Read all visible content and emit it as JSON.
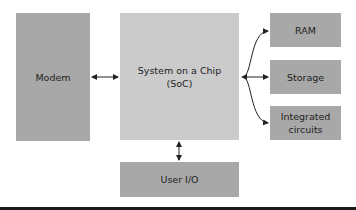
{
  "diagram": {
    "nodes": {
      "modem": {
        "label": "Modem"
      },
      "soc": {
        "label_line1": "System on a Chip",
        "label_line2": "(SoC)"
      },
      "ram": {
        "label": "RAM"
      },
      "storage": {
        "label": "Storage"
      },
      "ic": {
        "label_line1": "Integrated",
        "label_line2": "circuits"
      },
      "userio": {
        "label": "User I/O"
      }
    },
    "edges": [
      {
        "from": "modem",
        "to": "soc",
        "type": "bidirectional"
      },
      {
        "from": "soc",
        "to": "ram",
        "type": "directed"
      },
      {
        "from": "soc",
        "to": "storage",
        "type": "directed"
      },
      {
        "from": "soc",
        "to": "ic",
        "type": "directed"
      },
      {
        "from": "soc",
        "to": "userio",
        "type": "bidirectional"
      }
    ],
    "colors": {
      "dark_box": "#a8a8a8",
      "light_box": "#cbcbcb",
      "arrow": "#222222"
    }
  }
}
